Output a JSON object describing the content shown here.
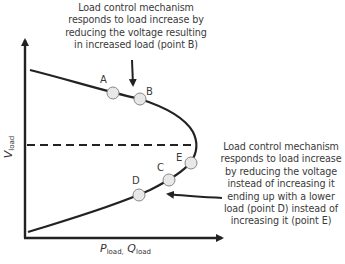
{
  "annotations": {
    "top": {
      "lines": [
        "Load control mechanism",
        "responds to load increase by",
        "reducing the voltage resulting",
        "in increased load (point B)"
      ]
    },
    "right": {
      "lines": [
        "Load control mechanism",
        "responds to load increase",
        "by reducing the voltage",
        "instead of increasing it",
        "ending up with a lower",
        "load (point D) instead of",
        "increasing it (point E)"
      ]
    }
  },
  "axes": {
    "x": {
      "main": "P",
      "sub": "load,",
      "main2": "Q",
      "sub2": "load"
    },
    "y": {
      "main": "V",
      "sub": "load"
    }
  },
  "points": {
    "A": "A",
    "B": "B",
    "C": "C",
    "D": "D",
    "E": "E"
  },
  "colors": {
    "curve": "#222222",
    "marker_fill": "#e8e8e8",
    "marker_stroke": "#888888",
    "text": "#3a3a3a"
  }
}
